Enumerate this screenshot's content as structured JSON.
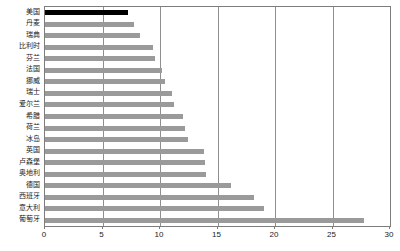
{
  "chart_data": {
    "type": "bar",
    "orientation": "horizontal",
    "title": "",
    "subtitle": "",
    "xlabel": "",
    "ylabel": "",
    "xlim": [
      0,
      30
    ],
    "ylim": null,
    "grid": true,
    "legend": null,
    "xticks": [
      0,
      5,
      10,
      15,
      20,
      25,
      30
    ],
    "xtick_labels": [
      "0",
      "5",
      "10",
      "15",
      "20",
      "25",
      "30"
    ],
    "categories": [
      "美国",
      "丹麦",
      "瑞典",
      "比利时",
      "芬兰",
      "法国",
      "挪威",
      "瑞士",
      "爱尔兰",
      "希腊",
      "荷兰",
      "冰岛",
      "英国",
      "卢森堡",
      "奥地利",
      "德国",
      "西班牙",
      "意大利",
      "葡萄牙"
    ],
    "values": [
      7.2,
      7.7,
      8.3,
      9.4,
      9.6,
      10.2,
      10.4,
      11.0,
      11.2,
      12.0,
      12.2,
      12.4,
      13.8,
      13.9,
      14.0,
      16.2,
      18.2,
      19.0,
      27.7
    ],
    "highlight_index": 0,
    "colors": {
      "bar": "#9a9a9a",
      "bar_highlight": "#000000",
      "grid": "#8f8f8f",
      "axis": "#7d7d7d",
      "text": "#1a1a1a",
      "background": "#ffffff"
    }
  }
}
